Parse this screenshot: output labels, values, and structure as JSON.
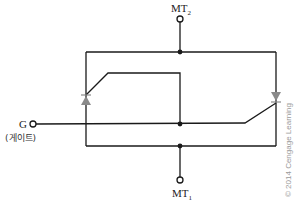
{
  "diagram": {
    "terminals": {
      "mt2": {
        "label": "MT",
        "subscript": "2"
      },
      "mt1": {
        "label": "MT",
        "subscript": "1"
      },
      "gate": {
        "label": "G",
        "korean_label": "(게이트)"
      }
    },
    "components": [
      {
        "name": "scr-left",
        "direction": "up",
        "color": "#8a8a8a"
      },
      {
        "name": "scr-right",
        "direction": "down",
        "color": "#8a8a8a"
      }
    ],
    "copyright": "© 2014 Cengage Learning",
    "colors": {
      "wire": "#1a1a1a",
      "scr": "#8a8a8a",
      "copyright": "#9a9a9a",
      "background": "#ffffff"
    }
  }
}
